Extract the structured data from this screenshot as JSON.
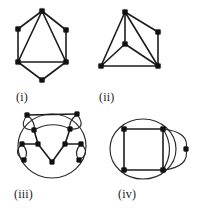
{
  "figure": {
    "kind": "graph-theory-figure",
    "background_color": "#ffffff",
    "ink_color": "#1c1c1c",
    "panel_count": 4,
    "panels": [
      {
        "id": "i",
        "label": "(i)",
        "description": "Hexagonal outer cycle with one apex vertex joined to two opposite vertices forming an inner triangle",
        "vertex_count": 6,
        "edge_count": 9,
        "vertices": [
          {
            "name": "top",
            "x": 42,
            "y": 11
          },
          {
            "name": "upper-left",
            "x": 18,
            "y": 29
          },
          {
            "name": "upper-right",
            "x": 66,
            "y": 30
          },
          {
            "name": "lower-left",
            "x": 18,
            "y": 62
          },
          {
            "name": "lower-right",
            "x": 66,
            "y": 62
          },
          {
            "name": "bottom",
            "x": 42,
            "y": 80
          }
        ],
        "edges": [
          [
            "top",
            "upper-left"
          ],
          [
            "top",
            "upper-right"
          ],
          [
            "upper-left",
            "lower-left"
          ],
          [
            "upper-right",
            "lower-right"
          ],
          [
            "lower-left",
            "bottom"
          ],
          [
            "lower-right",
            "bottom"
          ],
          [
            "lower-left",
            "lower-right"
          ],
          [
            "top",
            "lower-left"
          ],
          [
            "top",
            "lower-right"
          ]
        ]
      },
      {
        "id": "ii",
        "label": "(ii)",
        "description": "Triangle with a central vertex joined to all corners plus a right-hand side vertex",
        "vertex_count": 5,
        "edge_count": 8,
        "vertices": [
          {
            "name": "apex",
            "x": 125,
            "y": 12
          },
          {
            "name": "right-upper",
            "x": 158,
            "y": 32
          },
          {
            "name": "center",
            "x": 125,
            "y": 44
          },
          {
            "name": "bottom-left",
            "x": 101,
            "y": 66
          },
          {
            "name": "bottom-right",
            "x": 158,
            "y": 66
          }
        ],
        "edges": [
          [
            "apex",
            "right-upper"
          ],
          [
            "apex",
            "center"
          ],
          [
            "apex",
            "bottom-left"
          ],
          [
            "apex",
            "bottom-right"
          ],
          [
            "right-upper",
            "bottom-right"
          ],
          [
            "center",
            "bottom-left"
          ],
          [
            "center",
            "bottom-right"
          ],
          [
            "bottom-left",
            "bottom-right"
          ]
        ]
      },
      {
        "id": "iii",
        "label": "(iii)",
        "description": "Large circle with a chord path across the top, a V-shaped inner path, and four small lens-shaped multi-edges on the sides",
        "vertex_count": 10,
        "edge_count": 15,
        "vertices": [
          {
            "name": "top-left-outer",
            "x": 27,
            "y": 115
          },
          {
            "name": "top-right-outer",
            "x": 77,
            "y": 114
          },
          {
            "name": "upper-left",
            "x": 34,
            "y": 130
          },
          {
            "name": "upper-right",
            "x": 70,
            "y": 129
          },
          {
            "name": "mid-left-outer",
            "x": 22,
            "y": 144
          },
          {
            "name": "mid-left-inner",
            "x": 38,
            "y": 144
          },
          {
            "name": "mid-right-inner",
            "x": 65,
            "y": 144
          },
          {
            "name": "mid-right-outer",
            "x": 81,
            "y": 144
          },
          {
            "name": "low-left",
            "x": 24,
            "y": 160
          },
          {
            "name": "low-right",
            "x": 79,
            "y": 160
          },
          {
            "name": "v-bottom",
            "x": 52,
            "y": 162
          }
        ],
        "edges": [
          [
            "top-left-outer",
            "top-right-outer"
          ],
          [
            "top-left-outer",
            "upper-left"
          ],
          [
            "top-right-outer",
            "upper-right"
          ],
          [
            "upper-left",
            "mid-left-inner"
          ],
          [
            "upper-right",
            "mid-right-inner"
          ],
          [
            "mid-left-inner",
            "v-bottom"
          ],
          [
            "mid-right-inner",
            "v-bottom"
          ],
          [
            "mid-left-outer",
            "mid-left-inner"
          ],
          [
            "mid-right-inner",
            "mid-right-outer"
          ]
        ]
      },
      {
        "id": "iv",
        "label": "(iv)",
        "description": "Square inscribed in a circle with an extra lens-shaped pair of arcs bulging to the right meeting at an external vertex",
        "vertex_count": 5,
        "edge_count": 8,
        "vertices": [
          {
            "name": "square-top-left",
            "x": 124,
            "y": 129
          },
          {
            "name": "square-top-right",
            "x": 163,
            "y": 129
          },
          {
            "name": "square-bottom-left",
            "x": 124,
            "y": 170
          },
          {
            "name": "square-bottom-right",
            "x": 163,
            "y": 170
          },
          {
            "name": "right-outer",
            "x": 186,
            "y": 149
          }
        ],
        "edges": [
          [
            "square-top-left",
            "square-top-right"
          ],
          [
            "square-top-right",
            "square-bottom-right"
          ],
          [
            "square-bottom-right",
            "square-bottom-left"
          ],
          [
            "square-bottom-left",
            "square-top-left"
          ],
          [
            "square-top-right",
            "right-outer"
          ],
          [
            "square-bottom-right",
            "right-outer"
          ]
        ]
      }
    ]
  }
}
